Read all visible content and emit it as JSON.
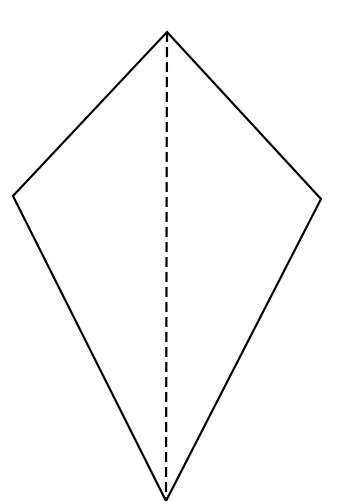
{
  "diagram": {
    "type": "kite",
    "colors": {
      "stroke": "#000000",
      "background": "#ffffff"
    },
    "vertices": {
      "top": [
        167,
        32
      ],
      "left": [
        13,
        196
      ],
      "right": [
        321,
        199
      ],
      "bottom": [
        166,
        501
      ]
    },
    "axis_of_symmetry": {
      "style": "dashed",
      "from": [
        167,
        32
      ],
      "to": [
        166,
        501
      ]
    }
  }
}
